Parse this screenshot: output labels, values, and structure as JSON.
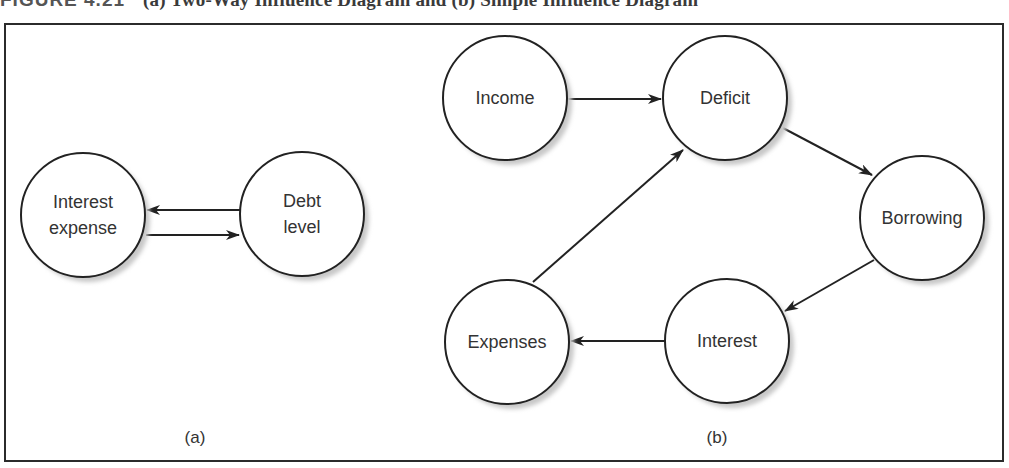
{
  "caption": {
    "figure_label": "FIGURE 4.21",
    "text": "(a) Two-Way Influence Diagram and (b) Simple Influence Diagram"
  },
  "colors": {
    "stroke": "#222222",
    "text": "#333333",
    "shadow": "#c8c8c8",
    "fill": "#ffffff"
  },
  "panels": [
    {
      "id": "a",
      "label": "(a)",
      "label_pos": {
        "x": 195,
        "y": 443
      },
      "nodes": [
        {
          "id": "interest_expense",
          "lines": [
            "Interest",
            "expense"
          ],
          "cx": 83,
          "cy": 215,
          "r": 62
        },
        {
          "id": "debt_level",
          "lines": [
            "Debt",
            "level"
          ],
          "cx": 302,
          "cy": 214,
          "r": 62
        }
      ],
      "edges": [
        {
          "from": "debt_level",
          "to": "interest_expense",
          "x1": 240,
          "y1": 210,
          "x2": 147,
          "y2": 210
        },
        {
          "from": "interest_expense",
          "to": "debt_level",
          "x1": 146,
          "y1": 235,
          "x2": 239,
          "y2": 235
        }
      ]
    },
    {
      "id": "b",
      "label": "(b)",
      "label_pos": {
        "x": 717,
        "y": 443
      },
      "nodes": [
        {
          "id": "income",
          "lines": [
            "Income"
          ],
          "cx": 505,
          "cy": 98,
          "r": 62
        },
        {
          "id": "deficit",
          "lines": [
            "Deficit"
          ],
          "cx": 725,
          "cy": 98,
          "r": 62
        },
        {
          "id": "borrowing",
          "lines": [
            "Borrowing"
          ],
          "cx": 922,
          "cy": 218,
          "r": 62
        },
        {
          "id": "interest",
          "lines": [
            "Interest"
          ],
          "cx": 727,
          "cy": 341,
          "r": 62
        },
        {
          "id": "expenses",
          "lines": [
            "Expenses"
          ],
          "cx": 507,
          "cy": 342,
          "r": 62
        }
      ],
      "edges": [
        {
          "from": "income",
          "to": "deficit",
          "x1": 568,
          "y1": 99,
          "x2": 661,
          "y2": 99
        },
        {
          "from": "deficit",
          "to": "borrowing",
          "x1": 783,
          "y1": 128,
          "x2": 872,
          "y2": 175
        },
        {
          "from": "borrowing",
          "to": "interest",
          "x1": 874,
          "y1": 260,
          "x2": 785,
          "y2": 311
        },
        {
          "from": "interest",
          "to": "expenses",
          "x1": 665,
          "y1": 341,
          "x2": 571,
          "y2": 341
        },
        {
          "from": "expenses",
          "to": "deficit",
          "x1": 533,
          "y1": 282,
          "x2": 683,
          "y2": 150
        }
      ]
    }
  ]
}
